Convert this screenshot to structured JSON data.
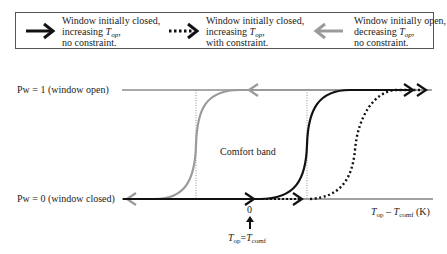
{
  "legend": {
    "items": [
      {
        "line1": "Window initially closed,",
        "line2_prefix": "increasing ",
        "line2_var": "T",
        "line2_sub": "op",
        "line2_suffix": ",",
        "line3": "no constraint.",
        "style": "solid-black",
        "direction": "right",
        "color": "#111111"
      },
      {
        "line1": "Window initially closed,",
        "line2_prefix": "increasing ",
        "line2_var": "T",
        "line2_sub": "op",
        "line2_suffix": ",",
        "line3": "with constraint.",
        "style": "dotted-black",
        "direction": "right",
        "color": "#111111"
      },
      {
        "line1": "Window initially open,",
        "line2_prefix": "decreasing ",
        "line2_var": "T",
        "line2_sub": "op",
        "line2_suffix": ",",
        "line3": "no constraint.",
        "style": "solid-grey",
        "direction": "left",
        "color": "#999999"
      }
    ]
  },
  "axes": {
    "top_label": "Pw = 1 (window open)",
    "bottom_label": "Pw = 0 (window closed)",
    "x_label_var1": "T",
    "x_label_sub1": "op",
    "x_label_minus": " – ",
    "x_label_var2": "T",
    "x_label_sub2": "comf",
    "x_label_unit": " (K)",
    "zero_tick": "0",
    "zero_annot_var1": "T",
    "zero_annot_sub1": "op",
    "zero_annot_eq": "=",
    "zero_annot_var2": "T",
    "zero_annot_sub2": "comf"
  },
  "annotations": {
    "comfort_band": "Comfort band"
  },
  "colors": {
    "black": "#111111",
    "grey": "#9a9a9a",
    "axis": "#444444"
  }
}
